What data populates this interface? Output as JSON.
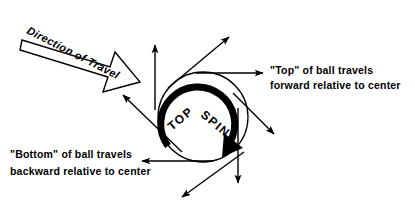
{
  "figure": {
    "kind": "topspin-ball-vector-diagram",
    "background_color": "#ffffff",
    "ink_color": "#000000",
    "width": 415,
    "height": 209
  },
  "travel_arrow": {
    "label": "Direction of Travel",
    "style": "hollow-block-arrow",
    "angle_deg": 27,
    "points_toward": "down-right"
  },
  "ball": {
    "center_x": 203,
    "center_y": 117,
    "radius": 45,
    "spin_label_part1": "TOP",
    "spin_label_part2": "SPIN",
    "spin_direction": "clockwise"
  },
  "annotations": {
    "top": {
      "line1": "\"Top\" of ball travels",
      "line2": "forward relative to center"
    },
    "bottom": {
      "line1": "\"Bottom\" of ball travels",
      "line2": "backward relative to center"
    }
  },
  "vectors": [
    {
      "name": "top-vertical-up",
      "x1": 155,
      "y1": 110,
      "x2": 155,
      "y2": 45
    },
    {
      "name": "upper-right-diagonal",
      "x1": 168,
      "y1": 88,
      "x2": 229,
      "y2": 37
    },
    {
      "name": "top-horizontal-right",
      "x1": 196,
      "y1": 73,
      "x2": 263,
      "y2": 73
    },
    {
      "name": "right-lower-diagonal",
      "x1": 233,
      "y1": 93,
      "x2": 274,
      "y2": 134
    },
    {
      "name": "right-vertical-down",
      "x1": 238,
      "y1": 108,
      "x2": 238,
      "y2": 183
    },
    {
      "name": "bottom-left-diagonal",
      "x1": 244,
      "y1": 152,
      "x2": 182,
      "y2": 197
    },
    {
      "name": "bottom-horizontal-left",
      "x1": 213,
      "y1": 161,
      "x2": 142,
      "y2": 161
    },
    {
      "name": "left-upper-diagonal",
      "x1": 182,
      "y1": 152,
      "x2": 123,
      "y2": 95
    }
  ]
}
